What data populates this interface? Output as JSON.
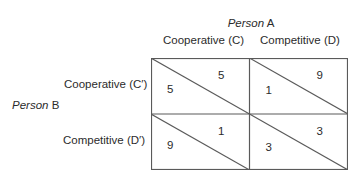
{
  "column_player": {
    "italic": "Person",
    "name": "A"
  },
  "row_player": {
    "italic": "Person",
    "name": "B"
  },
  "columns": [
    {
      "label": "Cooperative (C)"
    },
    {
      "label": "Competitive (D)"
    }
  ],
  "rows": [
    {
      "label": "Cooperative (C′)"
    },
    {
      "label": "Competitive (D′)"
    }
  ],
  "payoffs": [
    [
      {
        "b": "5",
        "a": "5"
      },
      {
        "b": "1",
        "a": "9"
      }
    ],
    [
      {
        "b": "9",
        "a": "1"
      },
      {
        "b": "3",
        "a": "3"
      }
    ]
  ],
  "legend": {
    "lower_left": "Person B payoff",
    "upper_right": "Person A payoff"
  },
  "colors": {
    "line": "#5a5a5a",
    "text": "#2b2b2b"
  }
}
